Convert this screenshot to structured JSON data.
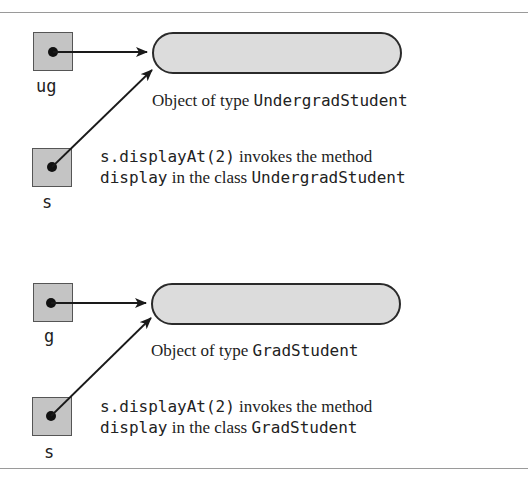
{
  "diagram": {
    "panels": [
      {
        "direct_var": "ug",
        "base_var": "s",
        "object_caption_prefix": "Object of type ",
        "object_type": "UndergradStudent",
        "call_code": "s.displayAt(2)",
        "call_text": " invokes the method",
        "method_code": "display",
        "class_text": " in the class ",
        "class_name": "UndergradStudent"
      },
      {
        "direct_var": "g",
        "base_var": "s",
        "object_caption_prefix": "Object of type ",
        "object_type": "GradStudent",
        "call_code": "s.displayAt(2)",
        "call_text": " invokes the method",
        "method_code": "display",
        "class_text": " in the class ",
        "class_name": "GradStudent"
      }
    ],
    "colors": {
      "box_fill": "#c4c4c4",
      "pill_fill": "#dcdcdc",
      "stroke": "#2a2a2a"
    }
  }
}
